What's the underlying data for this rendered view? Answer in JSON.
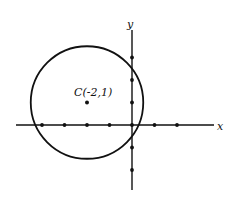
{
  "diagram": {
    "type": "coordinate-plane-circle",
    "x_axis_label": "x",
    "y_axis_label": "y",
    "x_ticks": [
      -4,
      -3,
      -2,
      -1,
      0,
      1,
      2
    ],
    "y_ticks": [
      3,
      2,
      1,
      0,
      -1,
      -2
    ],
    "circle": {
      "center": [
        -2,
        1
      ],
      "radius": 2.5,
      "center_label": "C(-2,1)"
    },
    "colors": {
      "ink": "#111111",
      "background": "#ffffff"
    }
  }
}
